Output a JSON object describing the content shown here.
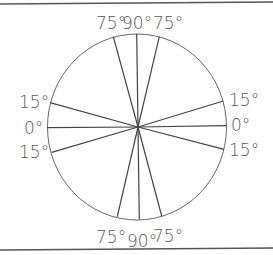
{
  "diagram": {
    "type": "protractor-circle",
    "colors": {
      "line": "#444444",
      "circle": "#666666",
      "text": "#555555",
      "frame": "#555555",
      "background": "#ffffff"
    },
    "frame": {
      "top_line": {
        "x1": 0,
        "y1": 4,
        "x2": 273,
        "y2": 2
      },
      "bottom_line": {
        "x1": 0,
        "y1": 250,
        "x2": 273,
        "y2": 248
      }
    },
    "circle": {
      "cx": 137,
      "cy": 127,
      "rx": 89.5,
      "ry": 93
    },
    "center": {
      "x": 138,
      "y": 127
    },
    "spokes": [
      {
        "id": "75-upper-left",
        "angle": 75,
        "x": 113.3,
        "y": 36.7
      },
      {
        "id": "90-top",
        "angle": 90,
        "x": 136.7,
        "y": 34
      },
      {
        "id": "75-upper-right",
        "angle": 75,
        "x": 159.3,
        "y": 36.7
      },
      {
        "id": "15-left-upper",
        "angle": 15,
        "x": 50,
        "y": 102.7
      },
      {
        "id": "0-left",
        "angle": 0,
        "x": 47.3,
        "y": 127.7
      },
      {
        "id": "15-left-lower",
        "angle": 15,
        "x": 51.7,
        "y": 152.3
      },
      {
        "id": "15-right-upper",
        "angle": 15,
        "x": 223.3,
        "y": 101
      },
      {
        "id": "0-right",
        "angle": 0,
        "x": 226,
        "y": 125.7
      },
      {
        "id": "15-right-lower",
        "angle": 15,
        "x": 224,
        "y": 149.3
      },
      {
        "id": "75-lower-left",
        "angle": 75,
        "x": 117.3,
        "y": 216.7
      },
      {
        "id": "90-bottom",
        "angle": 90,
        "x": 139.3,
        "y": 219.3
      },
      {
        "id": "75-lower-right",
        "angle": 75,
        "x": 161.7,
        "y": 216
      }
    ],
    "labels": {
      "top_left": {
        "text": "75°",
        "x": 96,
        "y": 29
      },
      "top_center": {
        "text": "90°",
        "x": 122,
        "y": 29
      },
      "top_right": {
        "text": "75°",
        "x": 153,
        "y": 29
      },
      "left_upper": {
        "text": "15°",
        "x": 19,
        "y": 108
      },
      "left_middle": {
        "text": "0°",
        "x": 24,
        "y": 134
      },
      "left_lower": {
        "text": "15°",
        "x": 19,
        "y": 158
      },
      "right_upper": {
        "text": "15°",
        "x": 229,
        "y": 106
      },
      "right_middle": {
        "text": "0°",
        "x": 231,
        "y": 131
      },
      "right_lower": {
        "text": "15°",
        "x": 229,
        "y": 156
      },
      "bottom_left": {
        "text": "75°",
        "x": 96,
        "y": 243
      },
      "bottom_center": {
        "text": "90°",
        "x": 127,
        "y": 247
      },
      "bottom_right": {
        "text": "75°",
        "x": 153,
        "y": 242
      }
    }
  }
}
